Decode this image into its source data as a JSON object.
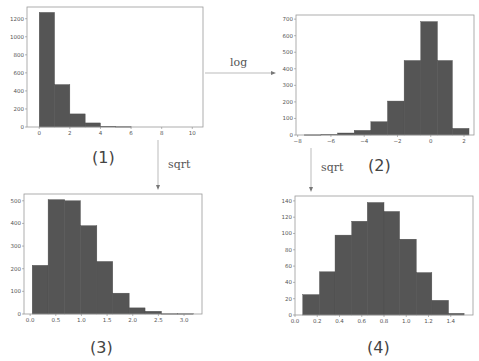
{
  "chart_data": [
    {
      "id": "plot1",
      "caption": "(1)",
      "type": "bar",
      "title": "",
      "xlabel": "",
      "ylabel": "",
      "bins": [
        [
          0,
          1
        ],
        [
          1,
          2
        ],
        [
          2,
          3
        ],
        [
          3,
          4
        ],
        [
          4,
          5
        ],
        [
          5,
          6
        ],
        [
          6,
          7
        ],
        [
          7,
          8
        ],
        [
          8,
          9
        ],
        [
          9,
          10
        ]
      ],
      "values": [
        1270,
        470,
        145,
        45,
        8,
        3,
        0,
        0,
        0,
        0
      ],
      "xlim": [
        -0.8,
        10.7
      ],
      "ylim": [
        0,
        1330
      ],
      "xticks": [
        0,
        2,
        4,
        6,
        8,
        10
      ],
      "yticks": [
        0,
        200,
        400,
        600,
        800,
        1000,
        1200
      ],
      "frame": {
        "x": 27,
        "y": 7,
        "w": 176,
        "h": 120
      }
    },
    {
      "id": "plot2",
      "caption": "(2)",
      "type": "bar",
      "title": "",
      "xlabel": "",
      "ylabel": "",
      "bins": [
        [
          -7.6,
          -6.6
        ],
        [
          -6.6,
          -5.6
        ],
        [
          -5.6,
          -4.6
        ],
        [
          -4.6,
          -3.6
        ],
        [
          -3.6,
          -2.6
        ],
        [
          -2.6,
          -1.6
        ],
        [
          -1.6,
          -0.6
        ],
        [
          -0.6,
          0.4
        ],
        [
          0.4,
          1.3
        ],
        [
          1.3,
          2.3
        ]
      ],
      "values": [
        1,
        3,
        12,
        28,
        80,
        205,
        450,
        685,
        450,
        40
      ],
      "xlim": [
        -8.1,
        2.6
      ],
      "ylim": [
        0,
        725
      ],
      "xticks": [
        -8,
        -6,
        -4,
        -2,
        0,
        2
      ],
      "yticks": [
        0,
        100,
        200,
        300,
        400,
        500,
        600,
        700
      ],
      "frame": {
        "x": 296,
        "y": 15,
        "w": 178,
        "h": 120
      }
    },
    {
      "id": "plot3",
      "caption": "(3)",
      "type": "bar",
      "title": "",
      "xlabel": "",
      "ylabel": "",
      "bins": [
        [
          0.04,
          0.35
        ],
        [
          0.35,
          0.67
        ],
        [
          0.67,
          0.98
        ],
        [
          0.98,
          1.3
        ],
        [
          1.3,
          1.61
        ],
        [
          1.61,
          1.93
        ],
        [
          1.93,
          2.24
        ],
        [
          2.24,
          2.56
        ],
        [
          2.56,
          2.87
        ],
        [
          2.87,
          3.18
        ]
      ],
      "values": [
        215,
        505,
        500,
        390,
        232,
        92,
        27,
        12,
        1,
        1
      ],
      "xlim": [
        -0.12,
        3.35
      ],
      "ylim": [
        0,
        530
      ],
      "xticks": [
        0.0,
        0.5,
        1.0,
        1.5,
        2.0,
        2.5,
        3.0
      ],
      "ytickLabels": [
        "0.0",
        "0.5",
        "1.0",
        "1.5",
        "2.0",
        "2.5",
        "3.0"
      ],
      "yticks": [
        0,
        100,
        200,
        300,
        400,
        500
      ],
      "frame": {
        "x": 24,
        "y": 194,
        "w": 178,
        "h": 120
      }
    },
    {
      "id": "plot4",
      "caption": "(4)",
      "type": "bar",
      "title": "",
      "xlabel": "",
      "ylabel": "",
      "bins": [
        [
          0.07,
          0.22
        ],
        [
          0.22,
          0.36
        ],
        [
          0.36,
          0.51
        ],
        [
          0.51,
          0.65
        ],
        [
          0.65,
          0.8
        ],
        [
          0.8,
          0.94
        ],
        [
          0.94,
          1.09
        ],
        [
          1.09,
          1.23
        ],
        [
          1.23,
          1.38
        ],
        [
          1.38,
          1.52
        ]
      ],
      "values": [
        25,
        53,
        98,
        115,
        138,
        127,
        93,
        52,
        18,
        2
      ],
      "xlim": [
        0.0,
        1.6
      ],
      "ylim": [
        0,
        146
      ],
      "xticks": [
        0.0,
        0.2,
        0.4,
        0.6,
        0.8,
        1.0,
        1.2,
        1.4
      ],
      "yticks": [
        0,
        20,
        40,
        60,
        80,
        100,
        120,
        140
      ],
      "frame": {
        "x": 295,
        "y": 196,
        "w": 178,
        "h": 119
      }
    }
  ],
  "captions": {
    "p1": "(1)",
    "p2": "(2)",
    "p3": "(3)",
    "p4": "(4)"
  },
  "arrows": {
    "log": "log",
    "sqrt_left": "sqrt",
    "sqrt_right": "sqrt"
  },
  "colors": {
    "bar": "#555555",
    "bar_edge": "#4a4a4a",
    "frame": "#999999",
    "arrow": "#999999"
  }
}
